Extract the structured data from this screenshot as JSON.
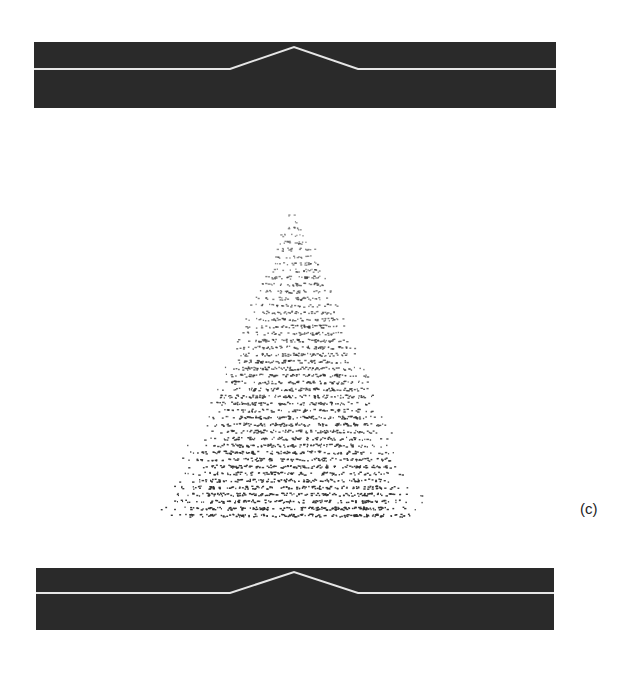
{
  "figure": {
    "panel_label": "(c)",
    "top_profile": {
      "band_color": "#2a2a2a",
      "line_color": "#e6e6e6",
      "baseline_y_frac": 0.42,
      "peak": {
        "start_x_frac": 0.375,
        "apex_x_frac": 0.5,
        "end_x_frac": 0.62,
        "apex_y_frac": 0.08
      }
    },
    "bottom_profile": {
      "band_color": "#2a2a2a",
      "line_color": "#e6e6e6",
      "baseline_y_frac": 0.42,
      "peak": {
        "start_x_frac": 0.375,
        "apex_x_frac": 0.5,
        "end_x_frac": 0.62,
        "apex_y_frac": 0.08
      }
    },
    "scatter": {
      "shape": "triangular cloud",
      "apex": {
        "x": 294,
        "y": 213
      },
      "base_left": {
        "x": 163,
        "y": 518
      },
      "base_right": {
        "x": 428,
        "y": 518
      },
      "dot_color": "#333333",
      "density": "increasing toward base"
    }
  }
}
